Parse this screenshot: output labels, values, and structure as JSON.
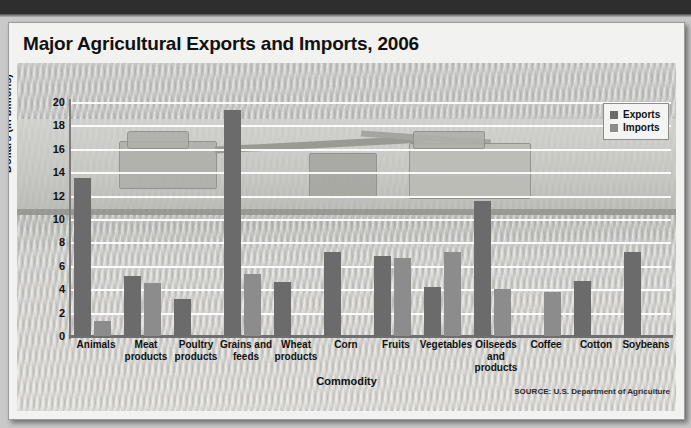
{
  "chart_data": {
    "type": "bar",
    "title": "Major Agricultural Exports and Imports, 2006",
    "xlabel": "Commodity",
    "ylabel": "Dollars (in billions)",
    "ylim": [
      0,
      20
    ],
    "yticks": [
      20,
      18,
      16,
      14,
      12,
      10,
      8,
      6,
      4,
      2,
      0
    ],
    "grid": true,
    "legend_position": "top-right",
    "categories": [
      "Animals",
      "Meat products",
      "Poultry products",
      "Grains and feeds",
      "Wheat products",
      "Corn",
      "Fruits",
      "Vegetables",
      "Oilseeds and products",
      "Coffee",
      "Cotton",
      "Soybeans"
    ],
    "series": [
      {
        "name": "Exports",
        "color": "#6b6b6b",
        "values": [
          13.5,
          5.1,
          3.2,
          19.3,
          4.6,
          7.2,
          6.8,
          4.2,
          11.5,
          0,
          4.7,
          7.2
        ]
      },
      {
        "name": "Imports",
        "color": "#8c8c8c",
        "values": [
          1.3,
          4.5,
          0,
          5.3,
          0,
          0,
          6.7,
          7.2,
          4.0,
          3.8,
          0,
          0
        ]
      }
    ],
    "source": "SOURCE: U.S. Department of Agriculture"
  },
  "legend": {
    "exports_label": "Exports",
    "imports_label": "Imports"
  }
}
